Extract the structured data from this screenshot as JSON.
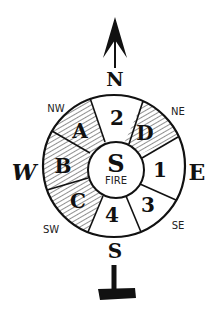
{
  "diagram": {
    "cardinals": {
      "north": "N",
      "south": "S",
      "east": "E",
      "west": "W"
    },
    "intercardinals": {
      "nw": "NW",
      "ne": "NE",
      "sw": "SW",
      "se": "SE"
    },
    "center": {
      "letter": "S",
      "label": "FIRE"
    },
    "segments": [
      {
        "label": "2",
        "hatched": false
      },
      {
        "label": "D",
        "hatched": true
      },
      {
        "label": "1",
        "hatched": false
      },
      {
        "label": "3",
        "hatched": false
      },
      {
        "label": "4",
        "hatched": false
      },
      {
        "label": "C",
        "hatched": true
      },
      {
        "label": "B",
        "hatched": true
      },
      {
        "label": "A",
        "hatched": true
      }
    ],
    "colors": {
      "ink": "#111111",
      "background": "#ffffff"
    }
  }
}
